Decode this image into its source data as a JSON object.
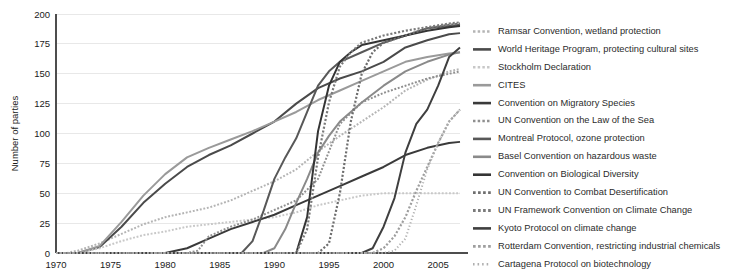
{
  "chart_data": {
    "type": "line",
    "title": "",
    "xlabel": "",
    "ylabel": "Number of parties",
    "xlim": [
      1970,
      2007
    ],
    "ylim": [
      0,
      200
    ],
    "grid": true,
    "legend_position": "right",
    "x_ticks": [
      1970,
      1975,
      1980,
      1985,
      1990,
      1995,
      2000,
      2005
    ],
    "y_ticks": [
      0,
      25,
      50,
      75,
      100,
      125,
      150,
      175,
      200
    ],
    "series": [
      {
        "name": "Ramsar Convention, wetland protection",
        "color": "#b4b4b4",
        "style": "dotted",
        "width": 2.0,
        "x": [
          1970,
          1971,
          1972,
          1974,
          1976,
          1978,
          1980,
          1982,
          1984,
          1986,
          1988,
          1990,
          1992,
          1994,
          1996,
          1998,
          2000,
          2002,
          2004,
          2006,
          2007
        ],
        "y": [
          0,
          0,
          2,
          8,
          16,
          24,
          30,
          34,
          38,
          44,
          52,
          60,
          70,
          85,
          98,
          110,
          122,
          136,
          145,
          152,
          154
        ]
      },
      {
        "name": "World Heritage Program, protecting cultural sites",
        "color": "#4a4a4a",
        "style": "solid",
        "width": 2.0,
        "x": [
          1970,
          1971,
          1972,
          1974,
          1976,
          1978,
          1980,
          1982,
          1984,
          1986,
          1988,
          1990,
          1992,
          1994,
          1996,
          1998,
          2000,
          2002,
          2004,
          2006,
          2007
        ],
        "y": [
          0,
          0,
          0,
          5,
          22,
          42,
          58,
          72,
          82,
          90,
          100,
          110,
          125,
          138,
          146,
          152,
          160,
          172,
          178,
          183,
          184
        ]
      },
      {
        "name": "Stockholm Declaration",
        "color": "#c8c8c8",
        "style": "dotted",
        "width": 2.0,
        "x": [
          1970,
          1972,
          1974,
          1976,
          1978,
          1980,
          1982,
          1984,
          1986,
          1988,
          1990,
          1992,
          1994,
          1996,
          1998,
          2000,
          2002,
          2004,
          2006,
          2007
        ],
        "y": [
          0,
          0,
          4,
          10,
          15,
          18,
          22,
          24,
          26,
          28,
          30,
          34,
          40,
          44,
          48,
          50,
          50,
          50,
          50,
          50
        ]
      },
      {
        "name": "CITES",
        "color": "#9a9a9a",
        "style": "solid",
        "width": 2.0,
        "x": [
          1970,
          1971,
          1972,
          1974,
          1976,
          1978,
          1980,
          1982,
          1984,
          1986,
          1988,
          1990,
          1992,
          1994,
          1996,
          1998,
          2000,
          2002,
          2004,
          2006,
          2007
        ],
        "y": [
          0,
          0,
          0,
          6,
          26,
          48,
          66,
          80,
          88,
          95,
          102,
          110,
          118,
          128,
          136,
          144,
          152,
          160,
          164,
          167,
          168
        ]
      },
      {
        "name": "Convention on Migratory Species",
        "color": "#3a3a3a",
        "style": "solid",
        "width": 2.0,
        "x": [
          1970,
          1978,
          1980,
          1982,
          1984,
          1986,
          1988,
          1990,
          1992,
          1994,
          1996,
          1998,
          2000,
          2002,
          2004,
          2006,
          2007
        ],
        "y": [
          0,
          0,
          0,
          4,
          12,
          20,
          26,
          32,
          40,
          48,
          56,
          64,
          72,
          82,
          88,
          92,
          93
        ]
      },
      {
        "name": "UN Convention on the Law of the Sea",
        "color": "#8f8f8f",
        "style": "dotted",
        "width": 2.0,
        "x": [
          1970,
          1982,
          1983,
          1984,
          1986,
          1988,
          1990,
          1992,
          1994,
          1996,
          1998,
          2000,
          2002,
          2004,
          2006,
          2007
        ],
        "y": [
          0,
          0,
          2,
          14,
          22,
          28,
          36,
          44,
          62,
          108,
          126,
          134,
          140,
          146,
          150,
          152
        ]
      },
      {
        "name": "Montreal Protocol, ozone protection",
        "color": "#585858",
        "style": "solid",
        "width": 2.0,
        "x": [
          1970,
          1987,
          1988,
          1989,
          1990,
          1991,
          1992,
          1993,
          1994,
          1995,
          1996,
          1998,
          2000,
          2002,
          2004,
          2006,
          2007
        ],
        "y": [
          0,
          0,
          10,
          35,
          62,
          80,
          96,
          118,
          140,
          152,
          160,
          168,
          176,
          182,
          188,
          190,
          191
        ]
      },
      {
        "name": "Basel Convention on hazardous waste",
        "color": "#8a8a8a",
        "style": "solid",
        "width": 2.0,
        "x": [
          1970,
          1989,
          1990,
          1991,
          1992,
          1993,
          1994,
          1995,
          1996,
          1998,
          2000,
          2002,
          2004,
          2006,
          2007
        ],
        "y": [
          0,
          0,
          4,
          20,
          42,
          62,
          84,
          98,
          110,
          126,
          140,
          152,
          160,
          166,
          168
        ]
      },
      {
        "name": "Convention on Biological Diversity",
        "color": "#343434",
        "style": "solid",
        "width": 2.0,
        "x": [
          1970,
          1992,
          1993,
          1994,
          1995,
          1996,
          1997,
          1998,
          2000,
          2002,
          2004,
          2006,
          2007
        ],
        "y": [
          0,
          0,
          30,
          102,
          140,
          160,
          168,
          174,
          178,
          182,
          186,
          189,
          190
        ]
      },
      {
        "name": "UN Convention to Combat Desertification",
        "color": "#6e6e6e",
        "style": "dotted",
        "width": 2.2,
        "x": [
          1970,
          1994,
          1995,
          1996,
          1997,
          1998,
          1999,
          2000,
          2002,
          2004,
          2006,
          2007
        ],
        "y": [
          0,
          0,
          8,
          50,
          110,
          150,
          168,
          176,
          182,
          188,
          191,
          192
        ]
      },
      {
        "name": "UN Framework Convention on Climate Change",
        "color": "#7a7a7a",
        "style": "dotted",
        "width": 2.2,
        "x": [
          1970,
          1992,
          1993,
          1994,
          1995,
          1996,
          1997,
          1998,
          2000,
          2002,
          2004,
          2006,
          2007
        ],
        "y": [
          0,
          0,
          20,
          80,
          126,
          156,
          168,
          176,
          182,
          186,
          189,
          192,
          193
        ]
      },
      {
        "name": "Kyoto Protocol on climate change",
        "color": "#3f3f3f",
        "style": "solid",
        "width": 2.0,
        "x": [
          1970,
          1998,
          1999,
          2000,
          2001,
          2002,
          2003,
          2004,
          2005,
          2006,
          2007
        ],
        "y": [
          0,
          0,
          4,
          22,
          46,
          84,
          108,
          120,
          140,
          164,
          172
        ]
      },
      {
        "name": "Rotterdam Convention, restricting industrial chemicals",
        "color": "#9e9e9e",
        "style": "dotted",
        "width": 2.2,
        "x": [
          1970,
          1998,
          1999,
          2000,
          2001,
          2002,
          2003,
          2004,
          2005,
          2006,
          2007
        ],
        "y": [
          0,
          0,
          0,
          4,
          14,
          30,
          52,
          72,
          92,
          110,
          120
        ]
      },
      {
        "name": "Cartagena Protocol on biotechnology",
        "color": "#b0b0b0",
        "style": "dense-dotted",
        "width": 2.0,
        "x": [
          1970,
          1999,
          2000,
          2001,
          2002,
          2003,
          2004,
          2005,
          2006,
          2007
        ],
        "y": [
          0,
          0,
          0,
          2,
          12,
          40,
          70,
          92,
          110,
          120
        ]
      }
    ]
  },
  "legend": {
    "items": [
      {
        "label": "Ramsar Convention, wetland protection"
      },
      {
        "label": "World Heritage Program, protecting cultural sites"
      },
      {
        "label": "Stockholm Declaration"
      },
      {
        "label": "CITES"
      },
      {
        "label": "Convention on Migratory Species"
      },
      {
        "label": "UN Convention on the Law of the Sea"
      },
      {
        "label": "Montreal Protocol, ozone protection"
      },
      {
        "label": "Basel Convention on hazardous waste"
      },
      {
        "label": "Convention on Biological Diversity"
      },
      {
        "label": "UN Convention to Combat Desertification"
      },
      {
        "label": "UN Framework Convention on Climate Change"
      },
      {
        "label": "Kyoto Protocol on climate change"
      },
      {
        "label": "Rotterdam Convention, restricting industrial chemicals"
      },
      {
        "label": "Cartagena Protocol on biotechnology"
      }
    ]
  }
}
